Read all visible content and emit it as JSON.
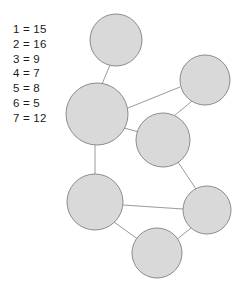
{
  "legend": {
    "name": "node-value-legend",
    "rows": [
      {
        "id": "1",
        "text": "1 = 15",
        "node": "1",
        "value": "15"
      },
      {
        "id": "2",
        "text": "2 = 16",
        "node": "2",
        "value": "16"
      },
      {
        "id": "3",
        "text": "3 = 9",
        "node": "3",
        "value": "9"
      },
      {
        "id": "4",
        "text": "4 = 7",
        "node": "4",
        "value": "7"
      },
      {
        "id": "5",
        "text": "5 = 8",
        "node": "5",
        "value": "8"
      },
      {
        "id": "6",
        "text": "6 = 5",
        "node": "6",
        "value": "5"
      },
      {
        "id": "7",
        "text": "7 = 12",
        "node": "7",
        "value": "12"
      }
    ]
  },
  "graph": {
    "colors": {
      "node_fill": "#d9d9d9",
      "node_stroke": "#8c8c8c",
      "edge_stroke": "#9a9a9a",
      "background": "#ffffff",
      "text": "#1a1a1a"
    },
    "nodes": [
      {
        "id": "n1",
        "label": "",
        "cx": 116,
        "cy": 40,
        "r": 26
      },
      {
        "id": "n2",
        "label": "",
        "cx": 97,
        "cy": 114,
        "r": 31
      },
      {
        "id": "n3",
        "label": "",
        "cx": 205,
        "cy": 80,
        "r": 25
      },
      {
        "id": "n4",
        "label": "",
        "cx": 163,
        "cy": 140,
        "r": 27
      },
      {
        "id": "n5",
        "label": "",
        "cx": 95,
        "cy": 202,
        "r": 28
      },
      {
        "id": "n6",
        "label": "",
        "cx": 207,
        "cy": 210,
        "r": 24
      },
      {
        "id": "n7",
        "label": "",
        "cx": 157,
        "cy": 253,
        "r": 25
      }
    ],
    "edges": [
      {
        "id": "e1",
        "from": "n1",
        "to": "n2",
        "x1": 110,
        "y1": 65,
        "x2": 102,
        "y2": 84
      },
      {
        "id": "e2",
        "from": "n2",
        "to": "n3",
        "x1": 128,
        "y1": 108,
        "x2": 180,
        "y2": 87
      },
      {
        "id": "e3",
        "from": "n2",
        "to": "n4",
        "x1": 124,
        "y1": 128,
        "x2": 139,
        "y2": 132
      },
      {
        "id": "e4",
        "from": "n2",
        "to": "n5",
        "x1": 95,
        "y1": 145,
        "x2": 95,
        "y2": 174
      },
      {
        "id": "e5",
        "from": "n3",
        "to": "n4",
        "x1": 192,
        "y1": 101,
        "x2": 174,
        "y2": 116
      },
      {
        "id": "e6",
        "from": "n4",
        "to": "n6",
        "x1": 178,
        "y1": 162,
        "x2": 196,
        "y2": 189
      },
      {
        "id": "e7",
        "from": "n5",
        "to": "n6",
        "x1": 123,
        "y1": 205,
        "x2": 183,
        "y2": 209
      },
      {
        "id": "e8",
        "from": "n5",
        "to": "n7",
        "x1": 114,
        "y1": 222,
        "x2": 139,
        "y2": 240
      },
      {
        "id": "e9",
        "from": "n6",
        "to": "n7",
        "x1": 191,
        "y1": 228,
        "x2": 176,
        "y2": 240
      }
    ]
  }
}
